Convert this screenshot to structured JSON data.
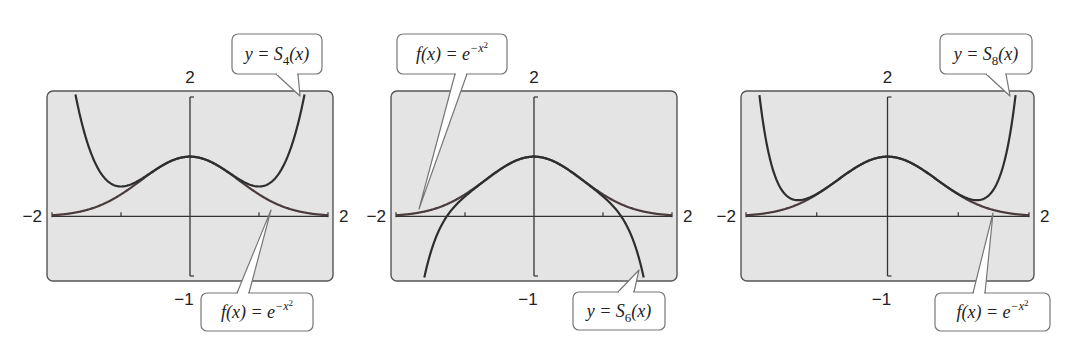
{
  "chart_data": [
    {
      "type": "line",
      "title": "",
      "xlabel": "",
      "ylabel": "",
      "xlim": [
        -2,
        2
      ],
      "ylim": [
        -1,
        2
      ],
      "x_tick_labels": [
        "−2",
        "2"
      ],
      "y_tick_labels": [
        "2",
        "−1"
      ],
      "x_ticks": [
        -1,
        1
      ],
      "grid": false,
      "series": [
        {
          "name": "f(x) = e^(−x²)",
          "kind": "gaussian"
        },
        {
          "name": "y = S4(x)",
          "kind": "taylor",
          "order": 4
        }
      ],
      "callouts": [
        {
          "text_parts": [
            "y = S",
            "4",
            "(x)"
          ],
          "type": "sub",
          "box": [
            232,
            34,
            90,
            40
          ],
          "tip": [
            300,
            96
          ],
          "base": [
            276,
            298
          ]
        },
        {
          "text_parts": [
            "f(x) = e",
            "−x",
            "2"
          ],
          "type": "exp",
          "box": [
            201,
            293,
            112,
            38
          ],
          "tip": [
            271,
            210
          ],
          "base": [
            237,
            249
          ]
        }
      ],
      "panel": [
        47,
        91,
        286,
        190
      ]
    },
    {
      "type": "line",
      "title": "",
      "xlabel": "",
      "ylabel": "",
      "xlim": [
        -2,
        2
      ],
      "ylim": [
        -1,
        2
      ],
      "x_tick_labels": [
        "−2",
        "2"
      ],
      "y_tick_labels": [
        "2",
        "−1"
      ],
      "x_ticks": [
        -1,
        1
      ],
      "grid": false,
      "series": [
        {
          "name": "f(x) = e^(−x²)",
          "kind": "gaussian"
        },
        {
          "name": "y = S6(x)",
          "kind": "taylor",
          "order": 6
        }
      ],
      "callouts": [
        {
          "text_parts": [
            "f(x) = e",
            "−x",
            "2"
          ],
          "type": "exp",
          "box": [
            397,
            34,
            110,
            40
          ],
          "tip": [
            419,
            209
          ],
          "base": [
            455,
            467
          ]
        },
        {
          "text_parts": [
            "y = S",
            "6",
            "(x)"
          ],
          "type": "sub",
          "box": [
            573,
            292,
            92,
            38
          ],
          "tip": [
            639,
            270
          ],
          "base": [
            618,
            634
          ]
        }
      ],
      "panel": [
        391,
        91,
        286,
        190
      ]
    },
    {
      "type": "line",
      "title": "",
      "xlabel": "",
      "ylabel": "",
      "xlim": [
        -2,
        2
      ],
      "ylim": [
        -1,
        2
      ],
      "x_tick_labels": [
        "−2",
        "2"
      ],
      "y_tick_labels": [
        "2",
        "−1"
      ],
      "x_ticks": [
        -1,
        1
      ],
      "grid": false,
      "series": [
        {
          "name": "f(x) = e^(−x²)",
          "kind": "gaussian"
        },
        {
          "name": "y = S8(x)",
          "kind": "taylor",
          "order": 8
        }
      ],
      "callouts": [
        {
          "text_parts": [
            "y = S",
            "8",
            "(x)"
          ],
          "type": "sub",
          "box": [
            940,
            34,
            92,
            40
          ],
          "tip": [
            1010,
            96
          ],
          "base": [
            986,
            1006
          ]
        },
        {
          "text_parts": [
            "f(x) = e",
            "−x",
            "2"
          ],
          "type": "exp",
          "box": [
            935,
            293,
            115,
            38
          ],
          "tip": [
            993,
            213
          ],
          "base": [
            973,
            985
          ]
        }
      ],
      "panel": [
        741,
        91,
        293,
        190
      ]
    }
  ],
  "colors": {
    "panel_fill": "#e4e4e4",
    "panel_stroke": "#555555",
    "curve_taylor": "#2e2e2e",
    "curve_gauss": "#4a3c3c",
    "axis": "#333333"
  }
}
